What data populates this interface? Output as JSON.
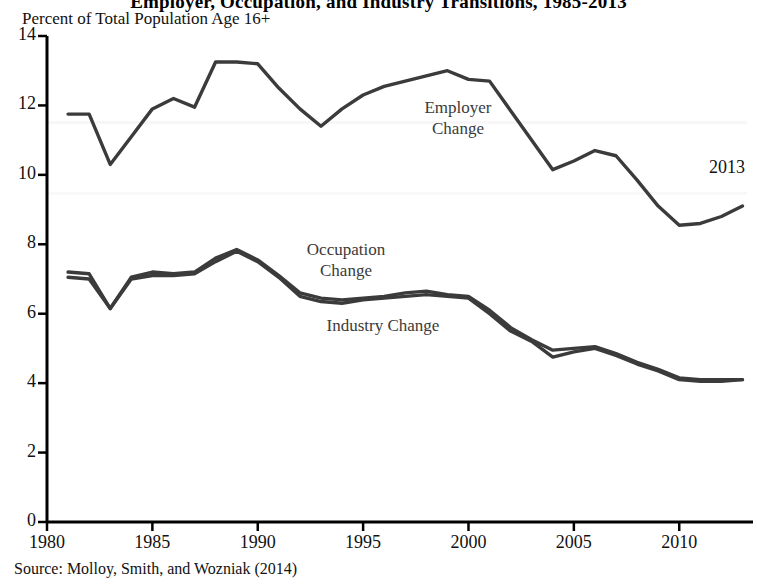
{
  "figure": {
    "title": "Employer, Occupation, and Industry Transitions, 1985-2013",
    "y_axis_unit_label": "Percent of Total Population Age 16+",
    "source": "Source: Molloy, Smith, and Wozniak (2014)",
    "end_year_annotation": "2013"
  },
  "annotations": {
    "employer_line1": "Employer",
    "employer_line2": "Change",
    "occupation_line1": "Occupation",
    "occupation_line2": "Change",
    "industry": "Industry Change"
  },
  "colors": {
    "line": "#3b3b3b",
    "axis": "#000000",
    "background": "#ffffff"
  },
  "chart_data": {
    "type": "line",
    "title": "Employer, Occupation, and Industry Transitions, 1985-2013",
    "xlabel": "",
    "ylabel": "Percent of Total Population Age 16+",
    "xlim": [
      1980,
      2013.5
    ],
    "ylim": [
      0,
      14
    ],
    "xticks": [
      1980,
      1985,
      1990,
      1995,
      2000,
      2005,
      2010
    ],
    "yticks": [
      0,
      2,
      4,
      6,
      8,
      10,
      12,
      14
    ],
    "grid": false,
    "legend": "inline-annotations",
    "x": [
      1981,
      1982,
      1983,
      1984,
      1985,
      1986,
      1987,
      1988,
      1989,
      1990,
      1991,
      1992,
      1993,
      1994,
      1995,
      1996,
      1997,
      1998,
      1999,
      2000,
      2001,
      2002,
      2003,
      2004,
      2005,
      2006,
      2007,
      2008,
      2009,
      2010,
      2011,
      2012,
      2013
    ],
    "series": [
      {
        "name": "Employer Change",
        "values": [
          11.75,
          11.75,
          10.3,
          11.1,
          11.9,
          12.2,
          11.95,
          13.25,
          13.25,
          13.2,
          12.5,
          11.9,
          11.4,
          11.9,
          12.3,
          12.55,
          12.7,
          12.85,
          13.0,
          12.75,
          12.7,
          11.85,
          11.0,
          10.15,
          10.4,
          10.7,
          10.55,
          9.85,
          9.1,
          8.55,
          8.6,
          8.8,
          9.1
        ]
      },
      {
        "name": "Occupation Change",
        "values": [
          7.2,
          7.15,
          6.15,
          7.05,
          7.2,
          7.15,
          7.2,
          7.6,
          7.85,
          7.55,
          7.1,
          6.6,
          6.45,
          6.4,
          6.45,
          6.5,
          6.6,
          6.65,
          6.55,
          6.5,
          6.1,
          5.6,
          5.25,
          4.95,
          5.0,
          5.05,
          4.85,
          4.6,
          4.4,
          4.15,
          4.1,
          4.1,
          4.1
        ]
      },
      {
        "name": "Industry Change",
        "values": [
          7.05,
          7.0,
          6.15,
          7.0,
          7.1,
          7.1,
          7.15,
          7.5,
          7.8,
          7.5,
          7.05,
          6.5,
          6.35,
          6.3,
          6.4,
          6.45,
          6.5,
          6.55,
          6.5,
          6.45,
          6.0,
          5.5,
          5.2,
          4.75,
          4.9,
          5.0,
          4.8,
          4.55,
          4.35,
          4.1,
          4.05,
          4.05,
          4.1
        ]
      }
    ]
  }
}
